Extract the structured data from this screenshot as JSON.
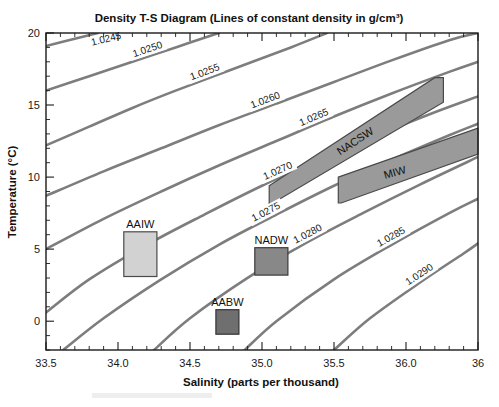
{
  "figure": {
    "title": "Density T-S Diagram (Lines of constant density in g/cm³)",
    "width": 499,
    "height": 407
  },
  "chart_data": {
    "type": "line",
    "title": "Density T-S Diagram (Lines of constant density in g/cm³)",
    "xlabel": "Salinity (parts per thousand)",
    "ylabel": "Temperature (°C)",
    "xlim": [
      33.5,
      36.5
    ],
    "ylim": [
      -2,
      20
    ],
    "grid": false,
    "legend": "none",
    "x_ticks": [
      {
        "value": 33.5,
        "label": "33.5"
      },
      {
        "value": 34.0,
        "label": "34.0"
      },
      {
        "value": 34.5,
        "label": "34.5"
      },
      {
        "value": 35.0,
        "label": "35.0"
      },
      {
        "value": 35.5,
        "label": "35.5"
      },
      {
        "value": 36.0,
        "label": "36.0"
      },
      {
        "value": 36.5,
        "label": "36"
      }
    ],
    "x_minor_step": 0.1,
    "y_ticks": [
      {
        "value": 0,
        "label": "0"
      },
      {
        "value": 5,
        "label": "5"
      },
      {
        "value": 10,
        "label": "10"
      },
      {
        "value": 15,
        "label": "15"
      },
      {
        "value": 20,
        "label": "20"
      }
    ],
    "y_minor_step": 1,
    "series": [
      {
        "name": "1.0245",
        "label": "1.0245",
        "label_at_x": 33.93,
        "points": [
          [
            33.5,
            19.1
          ],
          [
            33.7,
            19.6
          ],
          [
            33.86,
            20.0
          ]
        ]
      },
      {
        "name": "1.0250",
        "label": "1.0250",
        "label_at_x": 34.22,
        "points": [
          [
            33.5,
            16.0
          ],
          [
            33.8,
            17.0
          ],
          [
            34.1,
            18.0
          ],
          [
            34.4,
            19.0
          ],
          [
            34.7,
            20.0
          ]
        ]
      },
      {
        "name": "1.0255",
        "label": "1.0255",
        "label_at_x": 34.62,
        "points": [
          [
            33.5,
            12.2
          ],
          [
            33.8,
            13.5
          ],
          [
            34.1,
            14.8
          ],
          [
            34.4,
            16.0
          ],
          [
            34.8,
            17.5
          ],
          [
            35.2,
            19.0
          ],
          [
            35.45,
            20.0
          ]
        ]
      },
      {
        "name": "1.0260",
        "label": "1.0260",
        "label_at_x": 35.04,
        "points": [
          [
            33.5,
            8.7
          ],
          [
            33.9,
            10.4
          ],
          [
            34.3,
            12.0
          ],
          [
            34.7,
            13.6
          ],
          [
            35.1,
            15.1
          ],
          [
            35.5,
            16.6
          ],
          [
            35.9,
            18.1
          ],
          [
            36.3,
            19.5
          ],
          [
            36.5,
            20.0
          ]
        ]
      },
      {
        "name": "1.0265",
        "label": "1.0265",
        "label_at_x": 35.38,
        "points": [
          [
            33.5,
            5.0
          ],
          [
            33.9,
            7.1
          ],
          [
            34.3,
            9.0
          ],
          [
            34.7,
            10.8
          ],
          [
            35.1,
            12.5
          ],
          [
            35.5,
            14.2
          ],
          [
            35.9,
            15.8
          ],
          [
            36.3,
            17.3
          ],
          [
            36.5,
            18.0
          ]
        ]
      },
      {
        "name": "1.0270",
        "label": "1.0270",
        "label_at_x": 35.13,
        "points": [
          [
            33.5,
            0.6
          ],
          [
            33.8,
            2.9
          ],
          [
            34.2,
            5.3
          ],
          [
            34.6,
            7.4
          ],
          [
            35.0,
            9.4
          ],
          [
            35.4,
            11.2
          ],
          [
            35.8,
            12.9
          ],
          [
            36.2,
            14.5
          ],
          [
            36.5,
            15.6
          ]
        ]
      },
      {
        "name": "1.0275",
        "label": "1.0275",
        "label_at_x": 35.05,
        "points": [
          [
            33.62,
            -2.0
          ],
          [
            33.9,
            0.2
          ],
          [
            34.3,
            2.9
          ],
          [
            34.7,
            5.3
          ],
          [
            35.1,
            7.4
          ],
          [
            35.5,
            9.4
          ],
          [
            35.9,
            11.2
          ],
          [
            36.3,
            12.9
          ],
          [
            36.5,
            13.7
          ]
        ]
      },
      {
        "name": "1.0280",
        "label": "1.0280",
        "label_at_x": 35.34,
        "points": [
          [
            34.25,
            -2.0
          ],
          [
            34.5,
            0.2
          ],
          [
            34.9,
            3.0
          ],
          [
            35.3,
            5.4
          ],
          [
            35.7,
            7.5
          ],
          [
            36.1,
            9.5
          ],
          [
            36.5,
            11.4
          ]
        ]
      },
      {
        "name": "1.0285",
        "label": "1.0285",
        "label_at_x": 35.92,
        "points": [
          [
            34.88,
            -2.0
          ],
          [
            35.1,
            0.0
          ],
          [
            35.5,
            2.9
          ],
          [
            35.9,
            5.3
          ],
          [
            36.3,
            7.5
          ],
          [
            36.5,
            8.5
          ]
        ]
      },
      {
        "name": "1.0290",
        "label": "1.0290",
        "label_at_x": 36.12,
        "points": [
          [
            35.5,
            -2.0
          ],
          [
            35.75,
            0.2
          ],
          [
            36.1,
            2.7
          ],
          [
            36.4,
            4.7
          ],
          [
            36.5,
            5.4
          ]
        ]
      }
    ],
    "water_masses": [
      {
        "name": "AAIW",
        "label": "AAIW",
        "shape": "box",
        "salinity_range": [
          34.04,
          34.27
        ],
        "temperature_range": [
          3.1,
          6.2
        ],
        "fill": "#d2d2d2",
        "stroke": "#4a4a4a",
        "label_position": "above"
      },
      {
        "name": "NADW",
        "label": "NADW",
        "shape": "box",
        "salinity_range": [
          34.95,
          35.18
        ],
        "temperature_range": [
          3.2,
          5.1
        ],
        "fill": "#888888",
        "stroke": "#3a3a3a",
        "label_position": "above"
      },
      {
        "name": "AABW",
        "label": "AABW",
        "shape": "box",
        "salinity_range": [
          34.68,
          34.84
        ],
        "temperature_range": [
          -0.9,
          0.8
        ],
        "fill": "#6f6f6f",
        "stroke": "#333333",
        "label_position": "above"
      },
      {
        "name": "NACSW",
        "label": "NACSW",
        "shape": "band",
        "polygon": [
          [
            35.05,
            9.4
          ],
          [
            36.2,
            16.9
          ],
          [
            36.26,
            16.9
          ],
          [
            36.26,
            15.2
          ],
          [
            35.06,
            8.1
          ],
          [
            35.05,
            8.1
          ]
        ],
        "fill": "#9a9a9a",
        "stroke": "#4a4a4a",
        "label_angle": -33
      },
      {
        "name": "MIW",
        "label": "MIW",
        "shape": "band",
        "polygon": [
          [
            35.53,
            10.0
          ],
          [
            36.5,
            13.4
          ],
          [
            36.5,
            11.6
          ],
          [
            35.55,
            8.2
          ],
          [
            35.53,
            8.2
          ]
        ],
        "fill": "#9a9a9a",
        "stroke": "#4a4a4a",
        "label_angle": -16
      }
    ]
  }
}
